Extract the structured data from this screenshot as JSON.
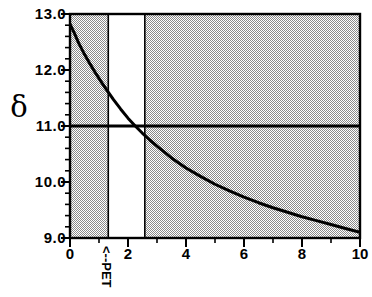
{
  "figure": {
    "background_color": "#ffffff",
    "axis_color": "#000000",
    "shade_color": "#b5b5b5",
    "curve_color": "#000000"
  },
  "y_axis": {
    "symbol": "δ",
    "symbol_name": "delta",
    "ticks": [
      13.0,
      12.0,
      11.0,
      10.0,
      9.0
    ],
    "tick_labels": [
      "13.0",
      "12.0",
      "11.0",
      "10.0",
      "9.0"
    ],
    "range": [
      9.0,
      13.0
    ],
    "minor_ticks_per_interval": 5
  },
  "x_axis": {
    "ticks": [
      0,
      2,
      4,
      6,
      8,
      10
    ],
    "tick_labels": [
      "0",
      "2",
      "4",
      "6",
      "8",
      "10"
    ],
    "range": [
      0,
      10
    ],
    "minor_ticks_per_interval": 2,
    "caption": ""
  },
  "annotations": [
    {
      "name": "pet-marker",
      "text": "<--PET",
      "x": 1.32,
      "orientation": "vertical"
    }
  ],
  "chart_data": {
    "type": "line",
    "title": "",
    "xlabel": "",
    "ylabel": "δ",
    "xlim": [
      0,
      10
    ],
    "ylim": [
      9.0,
      13.0
    ],
    "grid": false,
    "legend": null,
    "series": [
      {
        "name": "delta-curve",
        "color": "#000000",
        "line_width": 3,
        "x": [
          0.0,
          0.15,
          0.3,
          0.5,
          0.7,
          0.9,
          1.1,
          1.3,
          1.5,
          1.75,
          2.0,
          2.25,
          2.5,
          2.75,
          3.0,
          3.5,
          4.0,
          4.5,
          5.0,
          5.5,
          6.0,
          6.5,
          7.0,
          7.5,
          8.0,
          8.5,
          9.0,
          9.5,
          10.0
        ],
        "y": [
          12.82,
          12.66,
          12.48,
          12.28,
          12.1,
          11.93,
          11.77,
          11.62,
          11.47,
          11.3,
          11.14,
          11.0,
          10.87,
          10.75,
          10.64,
          10.43,
          10.25,
          10.1,
          9.96,
          9.84,
          9.73,
          9.63,
          9.54,
          9.46,
          9.38,
          9.31,
          9.24,
          9.17,
          9.1
        ]
      },
      {
        "name": "threshold-line",
        "type": "horizontal-line",
        "color": "#000000",
        "line_width": 3,
        "y": 11.0
      }
    ],
    "shaded_regions": [
      {
        "name": "left-shaded-band",
        "x_start": 0.0,
        "x_end": 1.32,
        "fill": "#b5b5b5",
        "pattern": "checker"
      },
      {
        "name": "right-shaded-band",
        "x_start": 2.58,
        "x_end": 10.0,
        "fill": "#b5b5b5",
        "pattern": "checker"
      }
    ],
    "unshaded_region": {
      "name": "white-window",
      "x_start": 1.32,
      "x_end": 2.58
    },
    "vertical_boundaries": [
      {
        "name": "left-window-edge",
        "x": 1.32
      },
      {
        "name": "right-window-edge",
        "x": 2.58
      }
    ]
  }
}
